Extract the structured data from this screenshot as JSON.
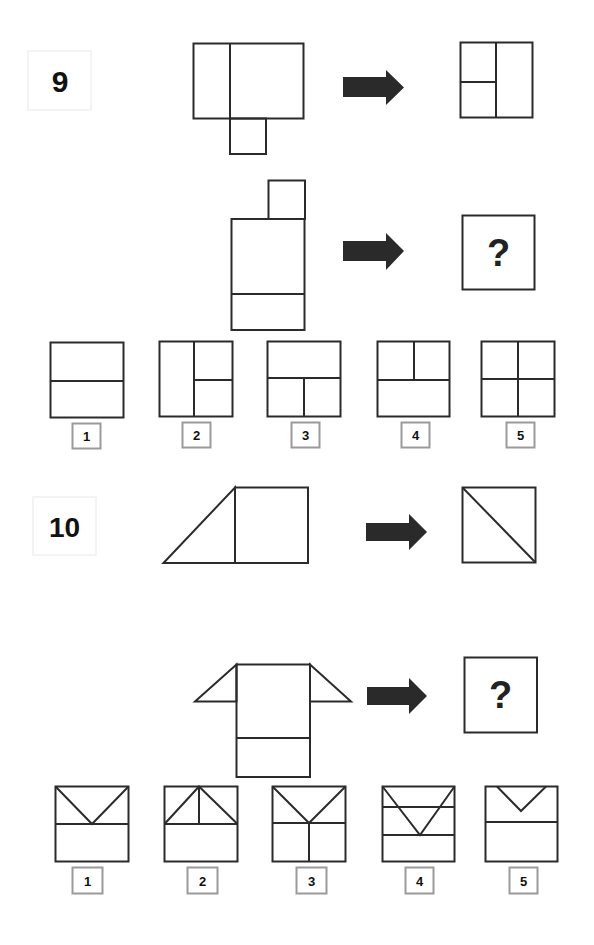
{
  "puzzles": [
    {
      "number": "9",
      "example": {
        "input": "Tall rectangle split by vertical line into narrow left and wide right sections, with small square attached below the divider",
        "output": "Square split vertically in half; left half split horizontally into two"
      },
      "question": {
        "input": "Rectangle with horizontal line near bottom, small square attached on top right",
        "output_placeholder": "?"
      },
      "options": [
        {
          "label": "1",
          "description": "Square split horizontally in half"
        },
        {
          "label": "2",
          "description": "Square split vertically; right half split horizontally"
        },
        {
          "label": "3",
          "description": "Square split horizontally; bottom half split vertically"
        },
        {
          "label": "4",
          "description": "Square split horizontally; top half split vertically"
        },
        {
          "label": "5",
          "description": "Square split into four quadrants"
        }
      ]
    },
    {
      "number": "10",
      "example": {
        "input": "Right triangle attached to left side of a square",
        "output": "Square with diagonal from top-left to bottom-right"
      },
      "question": {
        "input": "Rectangle with horizontal line near bottom and triangles attached on both upper sides",
        "output_placeholder": "?"
      },
      "options": [
        {
          "label": "1",
          "description": "Square split horizontally; V from top corners to middle line"
        },
        {
          "label": "2",
          "description": "Square split horizontally; triangle peak at top center with vertical line"
        },
        {
          "label": "3",
          "description": "Square split horizontally; V from top corners plus vertical line in bottom half"
        },
        {
          "label": "4",
          "description": "Square with two horizontal lines; V from top corners to lower line"
        },
        {
          "label": "5",
          "description": "Square split horizontally; small V notch at top"
        }
      ]
    }
  ],
  "colors": {
    "line": "#2b2b2b",
    "arrow": "#2a2a2a",
    "label_border": "#9a9a9a",
    "number_box_border": "#eeeeee"
  }
}
